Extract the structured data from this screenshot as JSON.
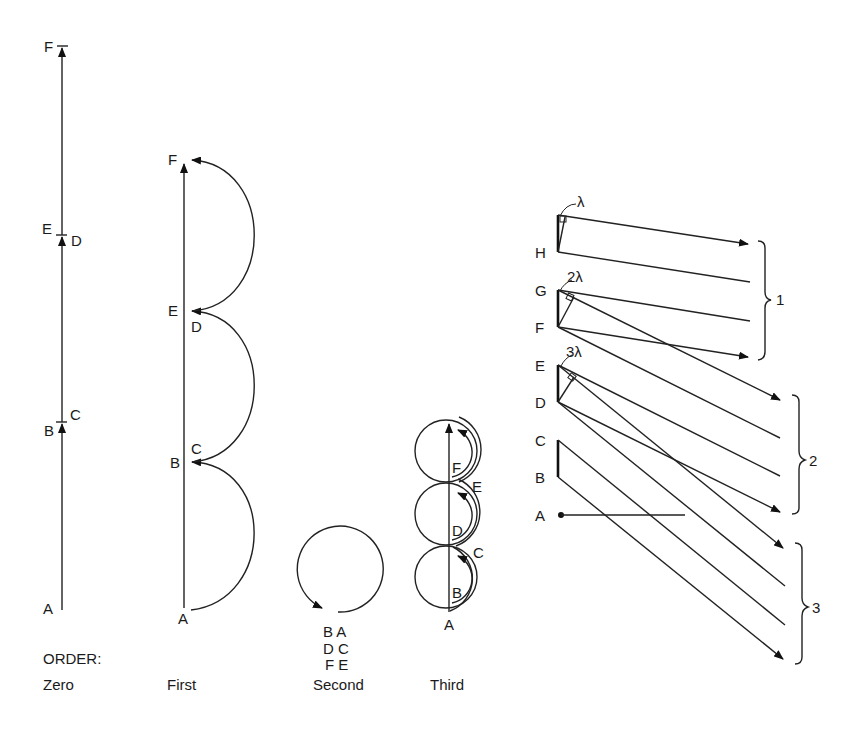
{
  "diagram": {
    "orders": {
      "heading": "ORDER:",
      "zero": {
        "caption": "Zero",
        "labels": {
          "F": "F",
          "E": "E",
          "D": "D",
          "B": "B",
          "C": "C",
          "A": "A"
        }
      },
      "first": {
        "caption": "First",
        "labels": {
          "F": "F",
          "E": "E",
          "D": "D",
          "B": "B",
          "C": "C",
          "A": "A"
        }
      },
      "second": {
        "caption": "Second",
        "pairs": [
          "B A",
          "D C",
          "F E"
        ]
      },
      "third": {
        "caption": "Third",
        "labels": {
          "F": "F",
          "E": "E",
          "D": "D",
          "C": "C",
          "B": "B",
          "A": "A"
        }
      }
    },
    "grating": {
      "point_labels": {
        "H": "H",
        "G": "G",
        "F": "F",
        "E": "E",
        "D": "D",
        "C": "C",
        "B": "B",
        "A": "A"
      },
      "path_differences": {
        "first": "λ",
        "second": "2λ",
        "third": "3λ"
      },
      "groups": {
        "g1": "1",
        "g2": "2",
        "g3": "3"
      }
    }
  }
}
